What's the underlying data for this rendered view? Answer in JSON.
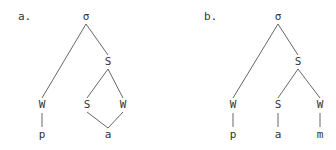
{
  "diagrams": [
    {
      "label": "a.",
      "nodes": [
        {
          "id": "root",
          "text": "σ"
        },
        {
          "id": "s1",
          "text": "S"
        },
        {
          "id": "w1",
          "text": "W"
        },
        {
          "id": "s2",
          "text": "S"
        },
        {
          "id": "w2",
          "text": "W"
        },
        {
          "id": "p",
          "text": "p"
        },
        {
          "id": "a",
          "text": "a"
        }
      ],
      "edges": [
        [
          "root",
          "w1"
        ],
        [
          "root",
          "s1"
        ],
        [
          "s1",
          "s2"
        ],
        [
          "s1",
          "w2"
        ],
        [
          "w1",
          "p"
        ],
        [
          "s2",
          "a"
        ],
        [
          "w2",
          "a"
        ]
      ]
    },
    {
      "label": "b.",
      "nodes": [
        {
          "id": "root",
          "text": "σ"
        },
        {
          "id": "s1",
          "text": "S"
        },
        {
          "id": "w1",
          "text": "W"
        },
        {
          "id": "s2",
          "text": "S"
        },
        {
          "id": "w2",
          "text": "W"
        },
        {
          "id": "p",
          "text": "p"
        },
        {
          "id": "a",
          "text": "a"
        },
        {
          "id": "m",
          "text": "m"
        }
      ],
      "edges": [
        [
          "root",
          "w1"
        ],
        [
          "root",
          "s1"
        ],
        [
          "s1",
          "s2"
        ],
        [
          "s1",
          "w2"
        ],
        [
          "w1",
          "p"
        ],
        [
          "s2",
          "a"
        ],
        [
          "w2",
          "m"
        ]
      ]
    }
  ]
}
